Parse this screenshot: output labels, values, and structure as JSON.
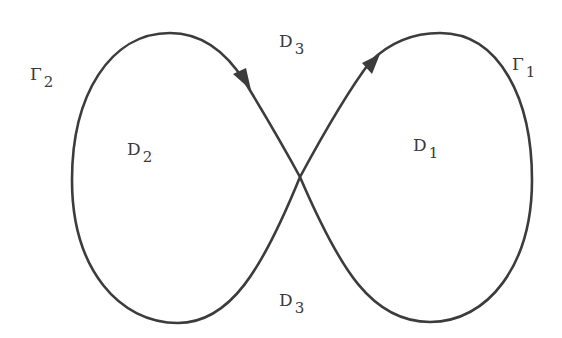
{
  "diagram": {
    "type": "figure-eight closed curve",
    "stroke_color": "#3c3c3c",
    "background": "#ffffff",
    "curves": [
      {
        "id": "Gamma_2",
        "label": "Γ",
        "subscript": "2",
        "loop": "left"
      },
      {
        "id": "Gamma_1",
        "label": "Γ",
        "subscript": "1",
        "loop": "right"
      }
    ],
    "regions": [
      {
        "id": "D_2",
        "label": "D",
        "subscript": "2",
        "position": "inside left loop"
      },
      {
        "id": "D_1",
        "label": "D",
        "subscript": "1",
        "position": "inside right loop"
      },
      {
        "id": "D_3_top",
        "label": "D",
        "subscript": "3",
        "position": "above crossing"
      },
      {
        "id": "D_3_bottom",
        "label": "D",
        "subscript": "3",
        "position": "below crossing"
      }
    ],
    "arrows": [
      {
        "on": "left loop, descending into crossing",
        "direction": "down-right"
      },
      {
        "on": "right loop, ascending from crossing",
        "direction": "up-right"
      }
    ]
  },
  "labels": {
    "gamma2": {
      "main": "Γ",
      "sub": "2"
    },
    "gamma1": {
      "main": "Γ",
      "sub": "1"
    },
    "d2": {
      "main": "D",
      "sub": "2"
    },
    "d1": {
      "main": "D",
      "sub": "1"
    },
    "d3_top": {
      "main": "D",
      "sub": "3"
    },
    "d3_bottom": {
      "main": "D",
      "sub": "3"
    }
  }
}
